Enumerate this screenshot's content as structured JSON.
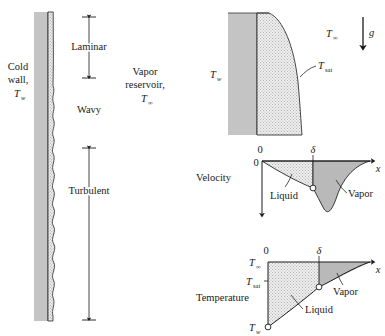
{
  "figure": {
    "background_color": "#ffffff",
    "ink_color": "#1a1a1a",
    "wall_fill": "#c4c4c4",
    "liquid_fill": "#e8e8e8",
    "vapor_fill": "#b8b8b8"
  },
  "panel_wall": {
    "name": "vertical wall regimes panel",
    "cold_wall_line1": "Cold",
    "cold_wall_line2": "wall,",
    "cold_wall_symbol": "T",
    "cold_wall_subscript": "w",
    "reservoir_line1": "Vapor",
    "reservoir_line2": "reservoir,",
    "reservoir_symbol": "T",
    "reservoir_subscript": "∞",
    "regimes": [
      {
        "label": "Laminar",
        "has_arrow": true
      },
      {
        "label": "Wavy",
        "has_arrow": false
      },
      {
        "label": "Turbulent",
        "has_arrow": true
      }
    ]
  },
  "panel_film": {
    "name": "condensate film detail panel",
    "wall_symbol": "T",
    "wall_subscript": "w",
    "infinity_symbol": "T",
    "infinity_subscript": "∞",
    "sat_symbol": "T",
    "sat_subscript": "sat",
    "gravity_label": "g",
    "gravity_direction": "down"
  },
  "panel_velocity": {
    "name": "velocity profile panel",
    "axis_label": "Velocity",
    "origin_tick": "0",
    "origin_tick_vertical": "0",
    "delta_tick": "δ",
    "x_axis_label": "x",
    "liquid_label": "Liquid",
    "vapor_label": "Vapor"
  },
  "panel_temperature": {
    "name": "temperature profile panel",
    "axis_label": "Temperature",
    "origin_tick": "0",
    "delta_tick": "δ",
    "x_axis_label": "x",
    "infinity_symbol": "T",
    "infinity_subscript": "∞",
    "sat_symbol": "T",
    "sat_subscript": "sat",
    "wall_symbol": "T",
    "wall_subscript": "w",
    "liquid_label": "Liquid",
    "vapor_label": "Vapor"
  }
}
